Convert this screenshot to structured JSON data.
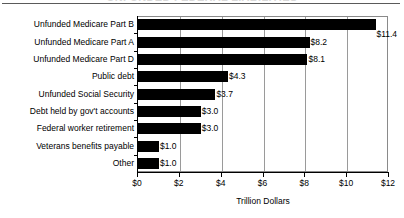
{
  "chart_data": {
    "type": "bar",
    "orientation": "horizontal",
    "title": "",
    "xlabel": "Trillion Dollars",
    "ylabel": "",
    "xlim": [
      0,
      12
    ],
    "xticks": [
      0,
      2,
      4,
      6,
      8,
      10,
      12
    ],
    "xtick_labels": [
      "$0",
      "$2",
      "$4",
      "$6",
      "$8",
      "$10",
      "$12"
    ],
    "grid": "vertical",
    "legend": "none",
    "categories": [
      "Unfunded Medicare Part B",
      "Unfunded Medicare Part A",
      "Unfunded Medicare Part D",
      "Public debt",
      "Unfunded Social Security",
      "Debt held by gov't accounts",
      "Federal worker retirement",
      "Veterans benefits payable",
      "Other"
    ],
    "values": [
      11.4,
      8.2,
      8.1,
      4.3,
      3.7,
      3.0,
      3.0,
      1.0,
      1.0
    ],
    "value_labels": [
      "$11.4",
      "$8.2",
      "$8.1",
      "$4.3",
      "$3.7",
      "$3.0",
      "$3.0",
      "$1.0",
      "$1.0"
    ],
    "bar_color": "#000000",
    "grid_color": "#9a9a9a",
    "background_color": "#ffffff"
  },
  "figure": {
    "cut_off_title": "UNFUNDED FEDERAL LIABILITIES",
    "axis_title": "Trillion Dollars"
  }
}
